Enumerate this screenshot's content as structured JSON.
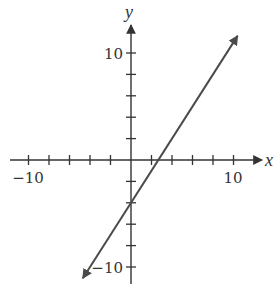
{
  "chart_data": {
    "type": "line",
    "title": "",
    "xlabel": "x",
    "ylabel": "y",
    "xlim": [
      -10.5,
      12.8
    ],
    "ylim": [
      -11,
      12.7
    ],
    "x_ticks": [
      -10,
      -8,
      -6,
      -4,
      -2,
      2,
      4,
      6,
      8,
      10
    ],
    "y_ticks": [
      -10,
      -8,
      -6,
      -4,
      -2,
      2,
      4,
      6,
      8,
      10
    ],
    "x_tick_labels": [
      {
        "value": -10,
        "label": "−10"
      },
      {
        "value": 10,
        "label": "10"
      }
    ],
    "y_tick_labels": [
      {
        "value": 10,
        "label": "10"
      },
      {
        "value": -10,
        "label": "−10"
      }
    ],
    "grid": false,
    "series": [
      {
        "name": "line",
        "equation": "y = 1.5x - 4",
        "slope": 1.5,
        "y_intercept": -4,
        "x_intercept": 2.67,
        "x": [
          -4.7,
          0,
          2.67,
          10.4
        ],
        "y": [
          -11.05,
          -4,
          0,
          11.6
        ],
        "arrows_both_ends": true,
        "color": "#4a4a4a"
      }
    ],
    "axis_color": "#333333"
  }
}
